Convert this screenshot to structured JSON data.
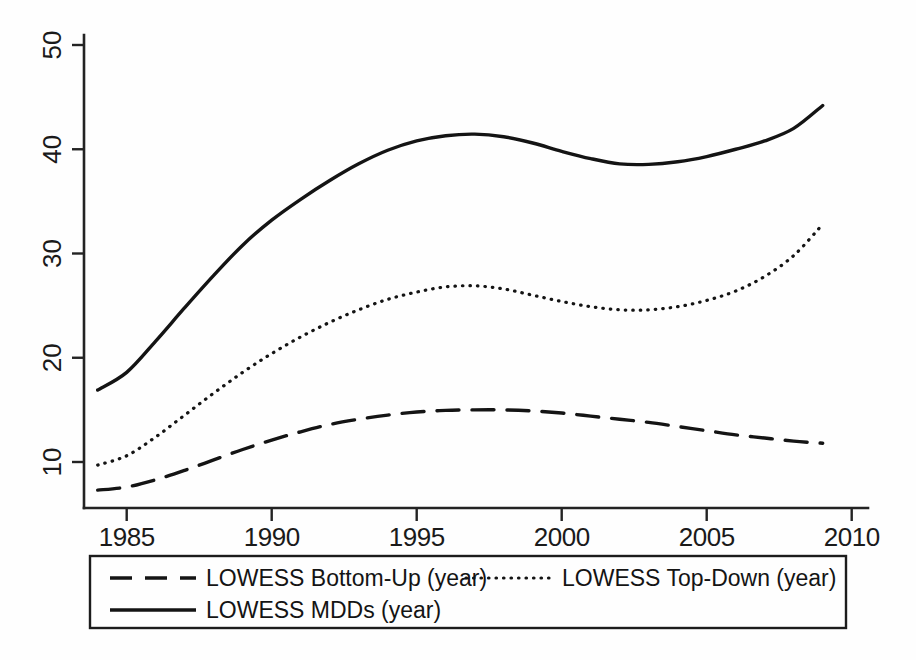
{
  "chart_data": {
    "type": "line",
    "title": "",
    "subtitle": "",
    "xlabel": "",
    "ylabel": "",
    "xlim": [
      1983.5,
      2010.6
    ],
    "ylim": [
      6,
      51
    ],
    "grid": false,
    "legend_position": "bottom",
    "xticks": [
      1985,
      1990,
      1995,
      2000,
      2005,
      2010
    ],
    "xtick_labels": [
      "1985",
      "1990",
      "1995",
      "2000",
      "2005",
      "2010"
    ],
    "yticks": [
      10,
      20,
      30,
      40,
      50
    ],
    "ytick_labels": [
      "10",
      "20",
      "30",
      "40",
      "50"
    ],
    "x": [
      1984,
      1985,
      1986,
      1987,
      1988,
      1989,
      1990,
      1991,
      1992,
      1993,
      1994,
      1995,
      1996,
      1997,
      1998,
      1999,
      2000,
      2001,
      2002,
      2003,
      2004,
      2005,
      2006,
      2007,
      2008,
      2009
    ],
    "series": [
      {
        "name": "LOWESS Bottom-Up (year)",
        "style": "dashed",
        "color": "#141414",
        "width": 3.4,
        "values": [
          7.3,
          7.6,
          8.3,
          9.2,
          10.2,
          11.2,
          12.1,
          12.9,
          13.6,
          14.1,
          14.5,
          14.8,
          14.95,
          15.0,
          15.0,
          14.9,
          14.7,
          14.4,
          14.1,
          13.8,
          13.4,
          13.0,
          12.6,
          12.3,
          12.0,
          11.8
        ]
      },
      {
        "name": "LOWESS Top-Down (year)",
        "style": "dotted",
        "color": "#141414",
        "width": 3.2,
        "values": [
          9.7,
          10.6,
          12.4,
          14.5,
          16.6,
          18.6,
          20.4,
          22.0,
          23.4,
          24.6,
          25.6,
          26.3,
          26.8,
          26.9,
          26.6,
          26.0,
          25.4,
          24.9,
          24.6,
          24.6,
          24.9,
          25.5,
          26.4,
          27.8,
          29.8,
          32.8
        ]
      },
      {
        "name": "LOWESS MDDs (year)",
        "style": "solid",
        "color": "#141414",
        "width": 3.4,
        "values": [
          16.9,
          18.6,
          21.6,
          24.8,
          27.9,
          30.8,
          33.2,
          35.2,
          37.0,
          38.6,
          39.9,
          40.8,
          41.3,
          41.45,
          41.2,
          40.6,
          39.8,
          39.1,
          38.6,
          38.55,
          38.8,
          39.3,
          40.0,
          40.8,
          42.0,
          44.2
        ]
      }
    ]
  },
  "legend": {
    "entries": [
      {
        "label": "LOWESS Bottom-Up (year)",
        "style": "dashed"
      },
      {
        "label": "LOWESS Top-Down (year)",
        "style": "dotted"
      },
      {
        "label": "LOWESS MDDs (year)",
        "style": "solid"
      }
    ]
  }
}
